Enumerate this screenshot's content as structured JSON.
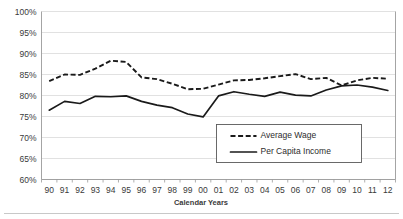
{
  "chart_data": {
    "type": "line",
    "title": "",
    "xlabel": "Calendar Years",
    "ylabel": "",
    "ylim": [
      60,
      100
    ],
    "ytick_step": 5,
    "grid": true,
    "legend_position": "inside-lower-right",
    "x": [
      "90",
      "91",
      "92",
      "93",
      "94",
      "95",
      "96",
      "97",
      "98",
      "99",
      "00",
      "01",
      "02",
      "03",
      "04",
      "05",
      "06",
      "07",
      "08",
      "09",
      "10",
      "11",
      "12"
    ],
    "ytick_labels": [
      "100%",
      "95%",
      "90%",
      "85%",
      "80%",
      "75%",
      "70%",
      "65%",
      "60%"
    ],
    "ytick_values": [
      100,
      95,
      90,
      85,
      80,
      75,
      70,
      65,
      60
    ],
    "series": [
      {
        "name": "Average Wage",
        "style": "dashed",
        "color": "#1a1a1a",
        "values": [
          83.4,
          85.0,
          84.9,
          86.4,
          88.3,
          88.0,
          84.3,
          83.9,
          82.8,
          81.5,
          81.6,
          82.6,
          83.6,
          83.7,
          84.1,
          84.6,
          85.1,
          83.9,
          84.2,
          82.4,
          83.6,
          84.2,
          84.0
        ]
      },
      {
        "name": "Per Capita Income",
        "style": "solid",
        "color": "#1a1a1a",
        "values": [
          76.5,
          78.6,
          78.1,
          79.8,
          79.7,
          79.9,
          78.6,
          77.7,
          77.1,
          75.6,
          74.9,
          79.9,
          80.9,
          80.3,
          79.8,
          80.8,
          80.1,
          79.9,
          81.3,
          82.3,
          82.5,
          82.0,
          81.2
        ]
      }
    ]
  },
  "legend": {
    "items": [
      {
        "label": "Average Wage",
        "style": "dashed"
      },
      {
        "label": "Per Capita Income",
        "style": "solid"
      }
    ]
  }
}
